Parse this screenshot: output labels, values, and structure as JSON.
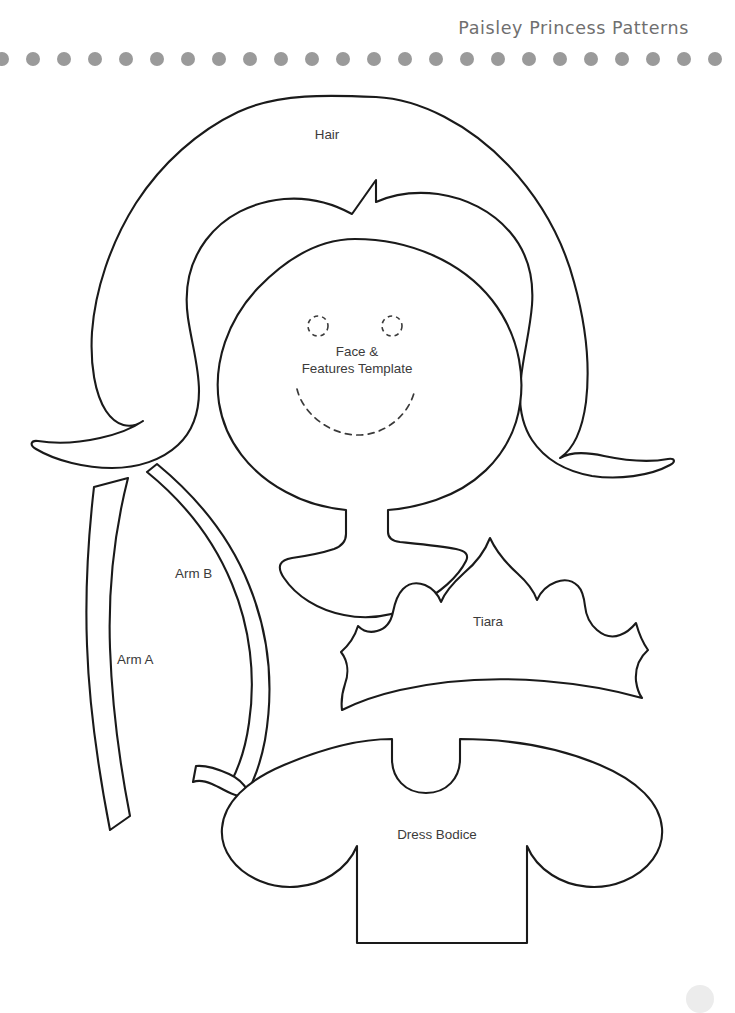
{
  "page": {
    "width": 735,
    "height": 1006,
    "background_color": "#ffffff",
    "ink_color": "#1a1a1a",
    "label_color": "#3b3b3b"
  },
  "header": {
    "title": "Paisley Princess Patterns",
    "title_color": "#6f6f6f",
    "divider": {
      "name": "dotted-rule",
      "dot_color": "#9a9a9a",
      "dot_count": 24,
      "dot_diameter": 14,
      "dot_spacing": 31
    }
  },
  "footer": {
    "corner_dot_color": "#ececec"
  },
  "pattern_pieces": [
    {
      "id": "hair",
      "label": "Hair",
      "label_x": 327,
      "label_y": 126
    },
    {
      "id": "face",
      "label": "Face &\nFeatures Template",
      "label_line_1": "Face &",
      "label_line_2": "Features Template",
      "label_x": 357,
      "label_y": 343
    },
    {
      "id": "arm-b",
      "label": "Arm B",
      "label_x": 175,
      "label_y": 565
    },
    {
      "id": "arm-a",
      "label": "Arm A",
      "label_x": 117,
      "label_y": 651
    },
    {
      "id": "tiara",
      "label": "Tiara",
      "label_x": 488,
      "label_y": 613
    },
    {
      "id": "dress-bodice",
      "label": "Dress Bodice",
      "label_x": 437,
      "label_y": 826
    }
  ],
  "face_features": {
    "left_eye": {
      "cx": 318,
      "cy": 326,
      "r": 10
    },
    "right_eye": {
      "cx": 392,
      "cy": 326,
      "r": 10
    },
    "smile": "dashed arc"
  }
}
